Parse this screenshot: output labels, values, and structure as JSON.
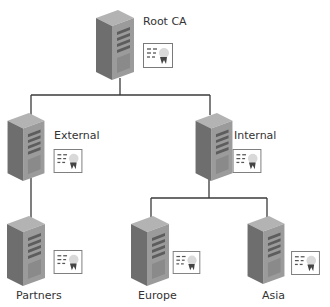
{
  "diagram": {
    "type": "pki-hierarchy",
    "colors": {
      "line": "#3a3a3a",
      "server_left": "#6f6f6f",
      "server_right": "#9a9a9a",
      "server_top": "#b0b0b0",
      "cert_border": "#7a7a7a",
      "cert_fill": "#ffffff"
    },
    "nodes": [
      {
        "id": "root",
        "label": "Root CA",
        "icon": "server-icon",
        "badge": "certificate-icon",
        "level": 0
      },
      {
        "id": "external",
        "label": "External",
        "icon": "server-icon",
        "badge": "certificate-icon",
        "level": 1,
        "parent": "root"
      },
      {
        "id": "internal",
        "label": "Internal",
        "icon": "server-icon",
        "badge": "certificate-icon",
        "level": 1,
        "parent": "root"
      },
      {
        "id": "partners",
        "label": "Partners",
        "icon": "server-icon",
        "badge": "certificate-icon",
        "level": 2,
        "parent": "external"
      },
      {
        "id": "europe",
        "label": "Europe",
        "icon": "server-icon",
        "badge": "certificate-icon",
        "level": 2,
        "parent": "internal"
      },
      {
        "id": "asia",
        "label": "Asia",
        "icon": "server-icon",
        "badge": "certificate-icon",
        "level": 2,
        "parent": "internal"
      }
    ]
  }
}
